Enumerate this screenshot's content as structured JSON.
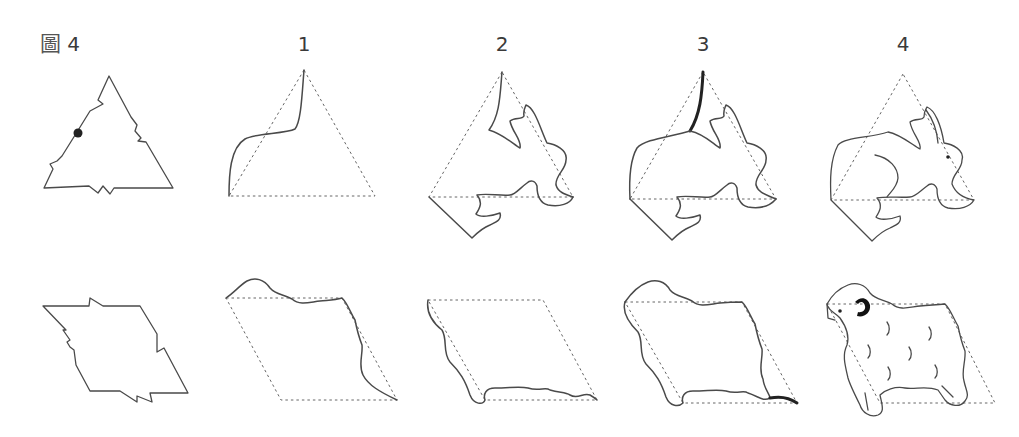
{
  "figure": {
    "prefix": "圖",
    "number": "4"
  },
  "steps": [
    {
      "label": "1"
    },
    {
      "label": "2"
    },
    {
      "label": "3"
    },
    {
      "label": "4"
    }
  ],
  "rows": [
    {
      "name": "triangle-rabbit",
      "base_shape": "triangle",
      "result": "rabbit"
    },
    {
      "name": "parallelogram-sheep",
      "base_shape": "parallelogram",
      "result": "sheep"
    }
  ],
  "colors": {
    "line": "#4a4a4a",
    "guide": "#666666",
    "highlight": "#222222",
    "background": "#ffffff"
  }
}
